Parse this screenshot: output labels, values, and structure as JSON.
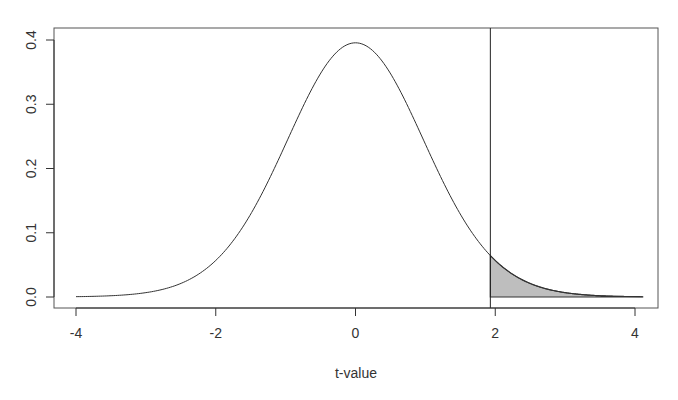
{
  "chart_data": {
    "type": "area",
    "title": "",
    "xlabel": "t-value",
    "ylabel": "",
    "xlim": [
      -4.3,
      4.3
    ],
    "ylim": [
      -0.017,
      0.42
    ],
    "grid": false,
    "legend": null,
    "x_ticks": [
      -4,
      -2,
      0,
      2,
      4
    ],
    "x_tick_labels": [
      "-4",
      "-2",
      "0",
      "2",
      "4"
    ],
    "y_ticks": [
      0.0,
      0.1,
      0.2,
      0.3,
      0.4
    ],
    "y_tick_labels": [
      "0.0",
      "0.1",
      "0.2",
      "0.3",
      "0.4"
    ],
    "distribution": "t",
    "df": 30,
    "curve_range": [
      -4.0,
      4.11
    ],
    "series": [
      {
        "name": "t density",
        "x": [
          -4.0,
          -3.5,
          -3.0,
          -2.5,
          -2.0,
          -1.5,
          -1.0,
          -0.5,
          0.0,
          0.5,
          1.0,
          1.5,
          1.93,
          2.0,
          2.5,
          3.0,
          3.5,
          4.0,
          4.11
        ],
        "y": [
          0.0003,
          0.0013,
          0.0048,
          0.0182,
          0.0546,
          0.1283,
          0.236,
          0.3469,
          0.3956,
          0.3469,
          0.236,
          0.1283,
          0.0632,
          0.0546,
          0.0182,
          0.0048,
          0.0013,
          0.0003,
          0.0002
        ]
      }
    ],
    "critical_value": 1.93,
    "shaded_region": {
      "from": 1.93,
      "to": 4.11,
      "fill": "#bebebe",
      "label": "upper tail"
    },
    "colors": {
      "curve": "#333333",
      "shade": "#bebebe",
      "axis": "#333333",
      "vline": "#222222"
    }
  },
  "axes": {
    "x_title": "t-value"
  }
}
